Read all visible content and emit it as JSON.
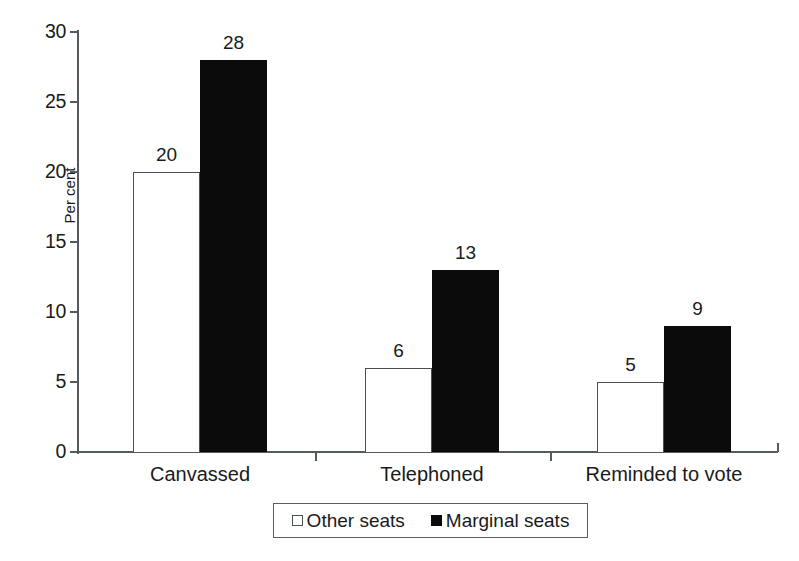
{
  "chart_data": {
    "type": "bar",
    "title": "",
    "subtitle": "",
    "xlabel": "",
    "ylabel": "Per cent",
    "ylim": [
      0,
      30
    ],
    "yticks": [
      0,
      5,
      10,
      15,
      20,
      25,
      30
    ],
    "ytick_labels": [
      "0",
      "5",
      "10",
      "15",
      "20",
      "25",
      "30"
    ],
    "grid": false,
    "legend_position": "bottom-center",
    "categories": [
      "Canvassed",
      "Telephoned",
      "Reminded to vote"
    ],
    "series": [
      {
        "name": "Other seats",
        "style": "open",
        "color": "#ffffff",
        "edge_color": "#4a4f51",
        "values": [
          20,
          6,
          5
        ],
        "value_labels": [
          "20",
          "6",
          "5"
        ]
      },
      {
        "name": "Marginal seats",
        "style": "filled",
        "color": "#0b0b0b",
        "edge_color": "#0b0b0b",
        "values": [
          28,
          13,
          9
        ],
        "value_labels": [
          "28",
          "13",
          "9"
        ]
      }
    ],
    "legend": [
      {
        "label": "Other seats",
        "marker": "open-square-marker"
      },
      {
        "label": "Marginal seats",
        "marker": "filled-square-marker"
      }
    ],
    "annotations": []
  }
}
